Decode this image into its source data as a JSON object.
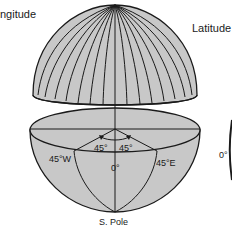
{
  "figure": {
    "title_left": "ngitude",
    "title_right": "Latitude",
    "colors": {
      "sphere_fill": "#c8c8c8",
      "line": "#1a1a1a",
      "background": "#ffffff"
    }
  },
  "labels": {
    "angle_left": "45°",
    "angle_right": "45°",
    "meridian_west": "45°W",
    "meridian_east": "45°E",
    "prime_meridian": "0°",
    "south_pole": "S. Pole",
    "latitude_zero": "0°"
  },
  "icons": {
    "upper_hemisphere": "dome-meridians",
    "lower_hemisphere": "bowl-cutaway",
    "angle_arrows": "arc-arrows"
  }
}
